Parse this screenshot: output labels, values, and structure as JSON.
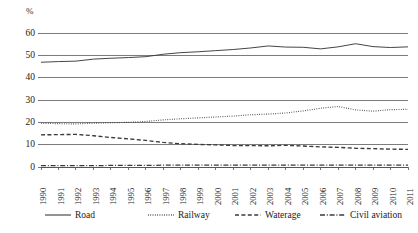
{
  "chart_data": {
    "type": "line",
    "title": "",
    "subtitle": "",
    "xlabel": "",
    "ylabel": "%",
    "unit_label": "%",
    "ylim": [
      0,
      60
    ],
    "ytick_step": 10,
    "yticks": [
      "0",
      "10",
      "20",
      "30",
      "40",
      "50",
      "60"
    ],
    "grid": true,
    "grid_axis": "y",
    "legend_position": "bottom",
    "categories": [
      "1990",
      "1991",
      "1992",
      "1993",
      "1994",
      "1995",
      "1996",
      "1997",
      "1998",
      "1999",
      "2000",
      "2001",
      "2002",
      "2003",
      "2004",
      "2005",
      "2006",
      "2007",
      "2008",
      "2009",
      "2010",
      "2011"
    ],
    "series": [
      {
        "name": "Road",
        "style": "solid",
        "color": "#3b3b3b",
        "values": [
          46.9,
          47.2,
          47.4,
          48.3,
          48.7,
          49.0,
          49.4,
          50.5,
          51.2,
          51.6,
          52.1,
          52.6,
          53.3,
          54.2,
          53.7,
          53.6,
          52.9,
          53.8,
          55.2,
          53.9,
          53.5,
          53.8
        ]
      },
      {
        "name": "Railway",
        "style": "dotted",
        "color": "#3b3b3b",
        "values": [
          19.6,
          19.4,
          19.3,
          19.6,
          19.8,
          20.0,
          20.4,
          21.1,
          21.6,
          22.0,
          22.4,
          22.8,
          23.4,
          23.7,
          24.2,
          25.1,
          26.3,
          27.1,
          25.6,
          25.0,
          25.7,
          25.8
        ]
      },
      {
        "name": "Waterage",
        "style": "dashed",
        "color": "#1f1f1f",
        "values": [
          14.4,
          14.5,
          14.6,
          14.0,
          13.2,
          12.6,
          11.9,
          11.0,
          10.4,
          10.1,
          9.9,
          9.6,
          9.6,
          9.5,
          9.7,
          9.4,
          9.0,
          8.8,
          8.4,
          8.2,
          8.0,
          7.9
        ]
      },
      {
        "name": "Civil aviation",
        "style": "dashdot",
        "color": "#1f1f1f",
        "values": [
          0.6,
          0.6,
          0.6,
          0.6,
          0.7,
          0.7,
          0.7,
          0.8,
          0.8,
          0.8,
          0.8,
          0.8,
          0.8,
          0.8,
          0.8,
          0.8,
          0.8,
          0.8,
          0.8,
          0.8,
          0.8,
          0.8
        ]
      }
    ]
  },
  "legend": {
    "items": [
      {
        "label": "Road",
        "style": "solid"
      },
      {
        "label": "Railway",
        "style": "dotted"
      },
      {
        "label": "Waterage",
        "style": "dashed"
      },
      {
        "label": "Civil aviation",
        "style": "dashdot"
      }
    ]
  }
}
